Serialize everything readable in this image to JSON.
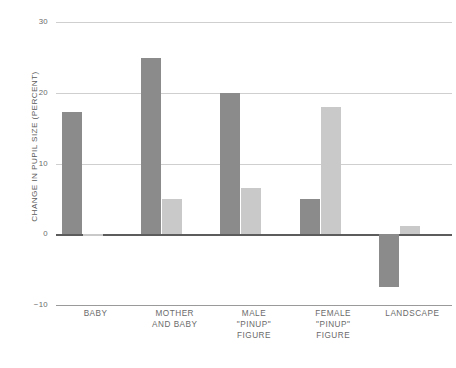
{
  "chart_data": {
    "type": "bar",
    "title": "",
    "xlabel": "",
    "ylabel": "CHANGE IN PUPIL SIZE (PERCENT)",
    "categories": [
      "BABY",
      "MOTHER AND BABY",
      "MALE \"PINUP\" FIGURE",
      "FEMALE \"PINUP\" FIGURE",
      "LANDSCAPE"
    ],
    "category_lines": [
      [
        "BABY"
      ],
      [
        "MOTHER",
        "AND BABY"
      ],
      [
        "MALE",
        "\"PINUP\"",
        "FIGURE"
      ],
      [
        "FEMALE",
        "\"PINUP\"",
        "FIGURE"
      ],
      [
        "LANDSCAPE"
      ]
    ],
    "series": [
      {
        "name": "series-dark",
        "color": "#8b8b8b",
        "values": [
          17.3,
          24.9,
          20.0,
          5.0,
          -7.5
        ]
      },
      {
        "name": "series-light",
        "color": "#c9c9c9",
        "values": [
          -0.2,
          5.0,
          6.5,
          18.0,
          1.2
        ]
      }
    ],
    "ylim": [
      -10,
      30
    ],
    "yticks": [
      30,
      20,
      10,
      0,
      -10
    ],
    "ytick_labels": [
      "30",
      "20",
      "10",
      "0",
      "−10"
    ],
    "grid": true,
    "legend": "none",
    "zero_line": 0
  },
  "colors": {
    "series_dark": "#8b8b8b",
    "series_light": "#c9c9c9",
    "gridline": "#cfcfcf",
    "zero_line": "#5c5c5c",
    "axis_text": "#6a6a6a",
    "background": "#ffffff"
  }
}
